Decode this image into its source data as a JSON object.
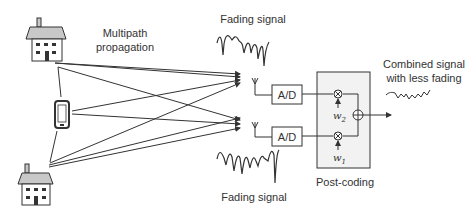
{
  "labels": {
    "multipath_line1": "Multipath",
    "multipath_line2": "propagation",
    "fading_top": "Fading signal",
    "fading_bottom": "Fading signal",
    "combined_line1": "Combined signal",
    "combined_line2": "with less fading",
    "ad_top": "A/D",
    "ad_bottom": "A/D",
    "post_coding": "Post-coding",
    "weight2_base": "w",
    "weight2_sub": "2",
    "weight1_base": "w",
    "weight1_sub": "1"
  },
  "colors": {
    "stroke": "#333333",
    "house_roof": "#c8c8c8",
    "box_fill": "#f2f2f2"
  }
}
